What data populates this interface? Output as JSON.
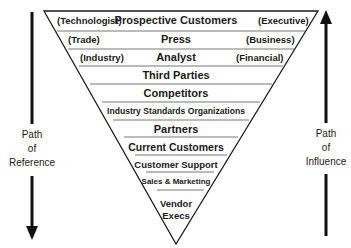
{
  "diagram": {
    "type": "inverted-pyramid",
    "levels": [
      {
        "label": "Prospective Customers",
        "left": "(Technologist)",
        "right": "(Executive)"
      },
      {
        "label": "Press",
        "left": "(Trade)",
        "right": "(Business)"
      },
      {
        "label": "Analyst",
        "left": "(Industry)",
        "right": "(Financial)"
      },
      {
        "label": "Third Parties"
      },
      {
        "label": "Competitors"
      },
      {
        "label": "Industry Standards Organizations"
      },
      {
        "label": "Partners"
      },
      {
        "label": "Current Customers"
      },
      {
        "label": "Customer Support"
      },
      {
        "label": "Sales & Marketing"
      },
      {
        "label": "Vendor Execs",
        "lines": [
          "Vendor",
          "Execs"
        ]
      }
    ],
    "left_arrow": {
      "direction": "down",
      "label_lines": [
        "Path",
        "of",
        "Reference"
      ]
    },
    "right_arrow": {
      "direction": "up",
      "label_lines": [
        "Path",
        "of",
        "Influence"
      ]
    },
    "colors": {
      "stroke": "#1a1a1a",
      "separator": "#555555",
      "background": "#ffffff"
    }
  }
}
